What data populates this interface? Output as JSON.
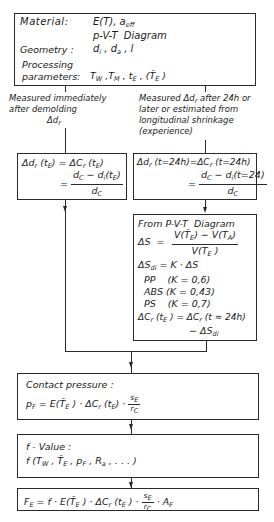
{
  "top_box": {
    "material_label": "Material:",
    "material_value": "E(T), a_eff",
    "pvt": "p-V-T  Diagram",
    "geometry_label": "Geometry :",
    "geometry_value": "d_i, d_a, l",
    "processing_label_1": "Processing",
    "processing_label_2": "parameters:",
    "processing_value": "T_W ,T_M , t_E , (T̄_E )"
  },
  "left_branch": {
    "caption_lines": [
      "Measured immediately",
      "after demolding",
      "Δd_r"
    ],
    "formula_line1": "Δd_r (t_E) = ΔC_r (t_E)",
    "formula_num": "d_C − d_i(t_E)",
    "formula_den": "d_C"
  },
  "right_branch": {
    "caption_lines": [
      "Measured Δd_r after 24h or",
      "later or estimated from",
      "longitudinal shrinkage",
      "(experience)"
    ],
    "formula_line1": "Δd_r (t=24h)=ΔC_r (t=24h)",
    "formula_num": "d_C − d_i(t=24)",
    "formula_den": "d_C"
  },
  "pvt_box": {
    "title": "From P-V-T  Diagram",
    "ds_label": "ΔS",
    "ds_num": "V(T̄_E) − V(T_A)",
    "ds_den": "V(T_E)",
    "sdi": "ΔS_di = K · ΔS",
    "materials": [
      {
        "name": "PP",
        "k": "(K = 0,6)"
      },
      {
        "name": "ABS",
        "k": "(K = 0,43)"
      },
      {
        "name": "PS",
        "k": "(K = 0,7)"
      }
    ],
    "final_line1": "ΔC_r (t_E) = ΔC_r (t ≈ 24h)",
    "final_line2": "− ΔS_di"
  },
  "contact_box": {
    "title": "Contact pressure :",
    "formula": "p_F = E(T̄_E) · ΔC_r (t_E) · s_E / r_C"
  },
  "f_box": {
    "title": "f - Value :",
    "formula": "f (T_W , T̄_E , p_F , R_a , . . . )"
  },
  "final_box": {
    "formula": "F_E = f · E(T̄_E) · ΔC_r (t_E) · s_E / r_C · A_F"
  }
}
